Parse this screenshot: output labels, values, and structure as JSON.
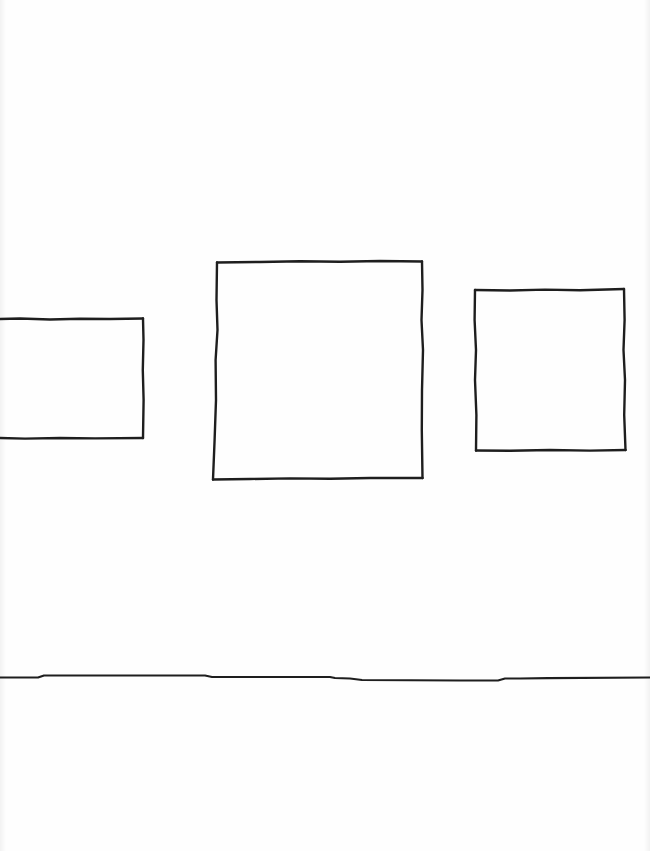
{
  "sketch": {
    "description": "Hand-drawn sketch of three frames hanging on a wall above a floor line",
    "stroke_color": "#1e1e1e",
    "background_color": "#ffffff",
    "stroke_width": 2.4,
    "frames": [
      {
        "name": "left-frame",
        "x": 0,
        "y": 319,
        "w": 143,
        "h": 119,
        "clipped_left": true
      },
      {
        "name": "center-frame",
        "x": 214,
        "y": 262,
        "w": 208,
        "h": 217
      },
      {
        "name": "right-frame",
        "x": 475,
        "y": 289,
        "w": 150,
        "h": 162
      }
    ],
    "floor_line": {
      "y_start": 678,
      "y_end": 678
    }
  }
}
